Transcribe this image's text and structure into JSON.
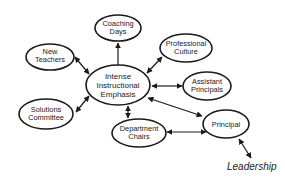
{
  "diagram": {
    "center": {
      "lines": [
        "Intense",
        "Instructional",
        "Emphasis"
      ]
    },
    "nodes": {
      "coaching_days": {
        "lines": [
          "Coaching",
          "Days"
        ]
      },
      "new_teachers": {
        "lines": [
          "New",
          "Teachers"
        ]
      },
      "professional_culture": {
        "lines": [
          "Professional",
          "Culture"
        ]
      },
      "assistant_principals": {
        "lines": [
          "Assistant",
          "Principals"
        ]
      },
      "solutions_committee": {
        "lines": [
          "Solutions",
          "Committee"
        ]
      },
      "department_chairs": {
        "lines": [
          "Department",
          "Chairs"
        ]
      },
      "principal": {
        "lines": [
          "Principal"
        ]
      }
    },
    "footer_label": "Leadership",
    "edges": [
      {
        "from": "Intense Instructional Emphasis",
        "to": "Coaching Days",
        "type": "one-way"
      },
      {
        "from": "New Teachers",
        "to": "Intense Instructional Emphasis",
        "type": "two-way"
      },
      {
        "from": "Intense Instructional Emphasis",
        "to": "Professional Culture",
        "type": "two-way"
      },
      {
        "from": "Intense Instructional Emphasis",
        "to": "Assistant Principals",
        "type": "two-way"
      },
      {
        "from": "Solutions Committee",
        "to": "Intense Instructional Emphasis",
        "type": "two-way"
      },
      {
        "from": "Intense Instructional Emphasis",
        "to": "Department Chairs",
        "type": "two-way"
      },
      {
        "from": "Intense Instructional Emphasis",
        "to": "Principal",
        "type": "two-way"
      },
      {
        "from": "Department Chairs",
        "to": "Principal",
        "type": "two-way"
      },
      {
        "from": "Principal",
        "to": "Leadership",
        "type": "two-way"
      }
    ]
  }
}
